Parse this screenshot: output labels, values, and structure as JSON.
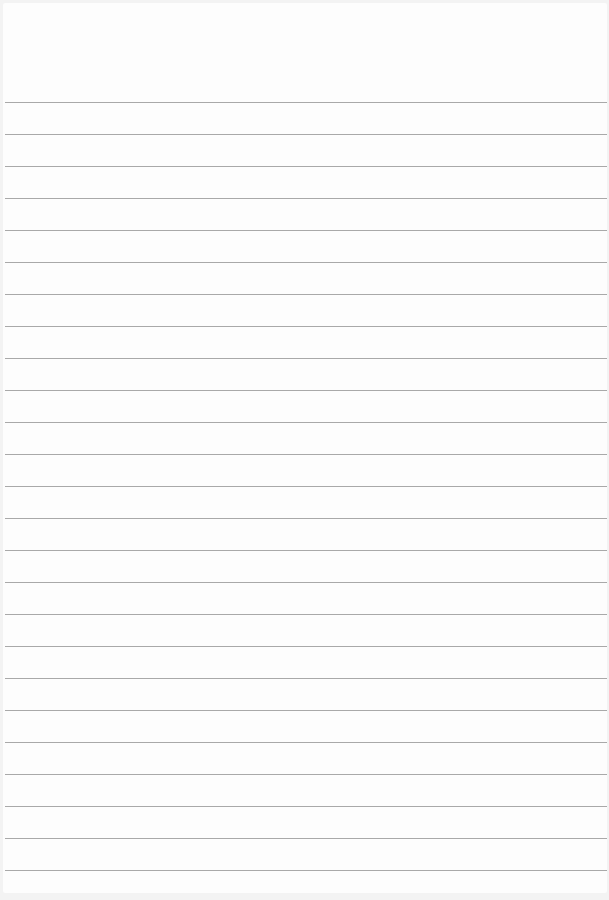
{
  "page": {
    "type": "lined-paper",
    "background": "#fdfdfd",
    "line_color": "#9a9a9a",
    "line_count": 25,
    "first_line_y": 102,
    "line_spacing": 32
  }
}
